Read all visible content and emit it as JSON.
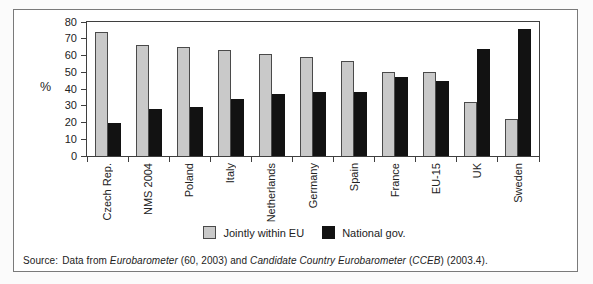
{
  "chart_data": {
    "type": "bar",
    "categories": [
      "Czech Rep.",
      "NMS 2004",
      "Poland",
      "Italy",
      "Netherlands",
      "Germany",
      "Spain",
      "France",
      "EU-15",
      "UK",
      "Sweden"
    ],
    "series": [
      {
        "name": "Jointly within EU",
        "color": "#c9c9c9",
        "values": [
          74,
          66,
          65,
          63,
          61,
          59,
          57,
          50,
          50,
          32,
          22
        ]
      },
      {
        "name": "National gov.",
        "color": "#121212",
        "values": [
          20,
          28,
          29,
          34,
          37,
          38,
          38,
          47,
          45,
          64,
          76
        ]
      }
    ],
    "title": "",
    "xlabel": "",
    "ylabel": "%",
    "ylim": [
      0,
      80
    ],
    "ytick_step": 10,
    "grid": false,
    "legend_position": "bottom",
    "bar_orientation": "vertical",
    "x_label_rotation": "90deg-ccw"
  },
  "source": {
    "prefix": "Source:",
    "part1": "Data from ",
    "italic1": "Eurobarometer",
    "part2": " (60, 2003) and ",
    "italic2": "Candidate Country Eurobarometer",
    "part3": " (",
    "italic3": "CCEB",
    "part4": ") (2003.4)."
  },
  "colors": {
    "bar_jointly_eu": "#c9c9c9",
    "bar_national_gov": "#121212",
    "bar_border": "#4a4a4a",
    "axis": "#3f3f3f",
    "text": "#222222",
    "frame_border": "#7a7a7a",
    "background": "#ffffff"
  }
}
